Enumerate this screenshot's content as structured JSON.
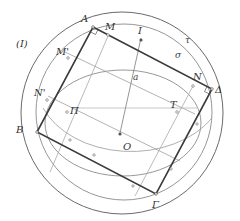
{
  "figure": {
    "figure_label": "(I)",
    "labels": {
      "A": "A",
      "B": "B",
      "Gamma": "Γ",
      "Delta": "Δ",
      "M": "M",
      "M_prime": "M'",
      "N": "N",
      "N_prime": "N'",
      "Pi": "Π",
      "T": "T",
      "I": "I",
      "O": "O",
      "a": "a",
      "sigma": "σ",
      "tau": "τ"
    },
    "colors": {
      "dark_line": "#3a3a3a",
      "mid_line": "#707070",
      "light_line": "#a8a8a8",
      "text": "#333333"
    }
  }
}
